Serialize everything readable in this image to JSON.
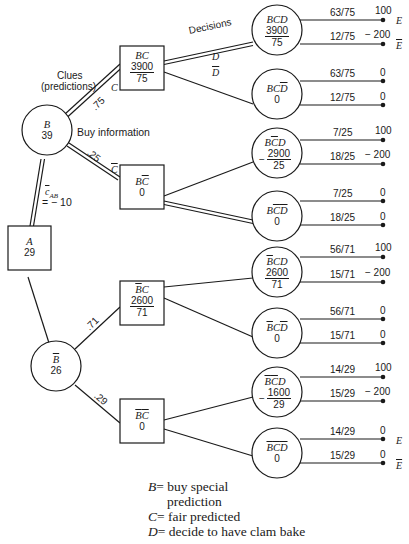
{
  "diagram": {
    "type": "decision-tree",
    "labels": {
      "clues": "Clues",
      "predictions": "(predictions)",
      "buy_information": "Buy information",
      "decisions": "Decisions",
      "cost_label": "c",
      "cost_sub": "AB",
      "cost_value": "= − 10"
    },
    "nodes": {
      "A": {
        "name": "A",
        "value": "29",
        "shape": "square"
      },
      "B": {
        "name": "B",
        "value": "39",
        "shape": "circle"
      },
      "Bbar": {
        "name": "B",
        "value": "26",
        "shape": "circle"
      },
      "BC": {
        "name": "BC",
        "num": "3900",
        "den": "75",
        "shape": "square"
      },
      "BCbar": {
        "name": "BC",
        "value": "0",
        "shape": "square"
      },
      "BbarC": {
        "name": "BC",
        "num": "2600",
        "den": "71",
        "shape": "square"
      },
      "BbarCbar": {
        "name": "BC",
        "value": "0",
        "shape": "square"
      },
      "BCD": {
        "name": "BCD",
        "num": "3900",
        "den": "75",
        "shape": "circle"
      },
      "BCDbar": {
        "name": "BCD",
        "value": "0",
        "shape": "circle"
      },
      "BCbarD": {
        "name": "BCD",
        "sign": "−",
        "num": "2900",
        "den": "25",
        "shape": "circle"
      },
      "BCbarDbar": {
        "name": "BCD",
        "value": "0",
        "shape": "circle"
      },
      "BbarCD": {
        "name": "BCD",
        "num": "2600",
        "den": "71",
        "shape": "circle"
      },
      "BbarCDbar": {
        "name": "BCD",
        "value": "0",
        "shape": "circle"
      },
      "BbarCbarD": {
        "name": "BCD",
        "sign": "−",
        "num": "1600",
        "den": "29",
        "shape": "circle"
      },
      "BbarCbarDbar": {
        "name": "BCD",
        "value": "0",
        "shape": "circle"
      }
    },
    "branches": {
      "B_C_prob": ".75",
      "B_Cbar_prob": ".25",
      "Bbar_C_prob": ".71",
      "Bbar_Cbar_prob": ".29",
      "C": "C",
      "Cbar": "C",
      "D": "D",
      "Dbar": "D"
    },
    "outcomes": [
      {
        "prob": "63/75",
        "payoff": "100",
        "end": "E"
      },
      {
        "prob": "12/75",
        "payoff": "− 200",
        "end": "E"
      },
      {
        "prob": "63/75",
        "payoff": "0"
      },
      {
        "prob": "12/75",
        "payoff": "0"
      },
      {
        "prob": "7/25",
        "payoff": "100"
      },
      {
        "prob": "18/25",
        "payoff": "− 200"
      },
      {
        "prob": "7/25",
        "payoff": "0"
      },
      {
        "prob": "18/25",
        "payoff": "0"
      },
      {
        "prob": "56/71",
        "payoff": "100"
      },
      {
        "prob": "15/71",
        "payoff": "− 200"
      },
      {
        "prob": "56/71",
        "payoff": "0"
      },
      {
        "prob": "15/71",
        "payoff": "0"
      },
      {
        "prob": "14/29",
        "payoff": "100"
      },
      {
        "prob": "15/29",
        "payoff": "− 200"
      },
      {
        "prob": "14/29",
        "payoff": "0",
        "end": "E"
      },
      {
        "prob": "15/29",
        "payoff": "0",
        "end": "E"
      }
    ]
  },
  "legend": {
    "B_key": "B",
    "B_text1": "= buy special",
    "B_text2": "prediction",
    "C_key": "C",
    "C_text": "= fair predicted",
    "D_key": "D",
    "D_text": "= decide to have clam bake"
  }
}
